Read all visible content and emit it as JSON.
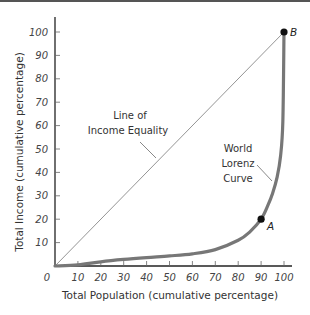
{
  "chart_data": {
    "type": "line",
    "title": "",
    "xlabel": "Total Population (cumulative percentage)",
    "ylabel": "Total Income (cumulative percentage)",
    "xlim": [
      0,
      100
    ],
    "ylim": [
      0,
      100
    ],
    "grid": false,
    "x_ticks": [
      "0",
      "10",
      "20",
      "30",
      "40",
      "50",
      "60",
      "70",
      "80",
      "90",
      "100"
    ],
    "y_ticks": [
      "10",
      "20",
      "30",
      "40",
      "50",
      "60",
      "70",
      "80",
      "90",
      "100"
    ],
    "series": [
      {
        "name": "Line of Income Equality",
        "label_lines": [
          "Line of",
          "Income Equality"
        ],
        "x": [
          0,
          100
        ],
        "y": [
          0,
          100
        ],
        "color": "#777777"
      },
      {
        "name": "World Lorenz Curve",
        "label_lines": [
          "World",
          "Lorenz",
          "Curve"
        ],
        "x": [
          0,
          10,
          20,
          30,
          40,
          50,
          60,
          70,
          80,
          85,
          90,
          93,
          95,
          97,
          98.5,
          99.5,
          100
        ],
        "y": [
          0,
          0.5,
          1.8,
          2.8,
          3.6,
          4.3,
          5.2,
          7,
          11,
          14.5,
          20,
          26,
          31,
          38,
          47,
          62,
          100
        ],
        "color": "#777777"
      }
    ],
    "points": [
      {
        "label": "A",
        "x": 90,
        "y": 20
      },
      {
        "label": "B",
        "x": 100,
        "y": 100
      }
    ]
  }
}
